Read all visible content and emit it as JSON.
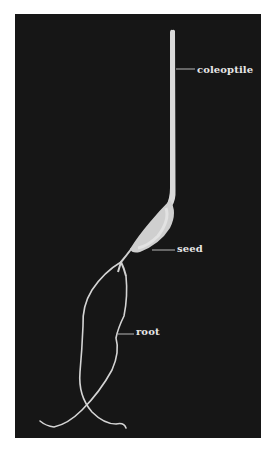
{
  "figure": {
    "background_color": "#ffffff",
    "panel_color": "#161616",
    "plant_color": "#d9d9d9",
    "label_color": "#e6e6e6",
    "labels": {
      "coleoptile": "coleoptile",
      "seed": "seed",
      "root": "root"
    }
  }
}
